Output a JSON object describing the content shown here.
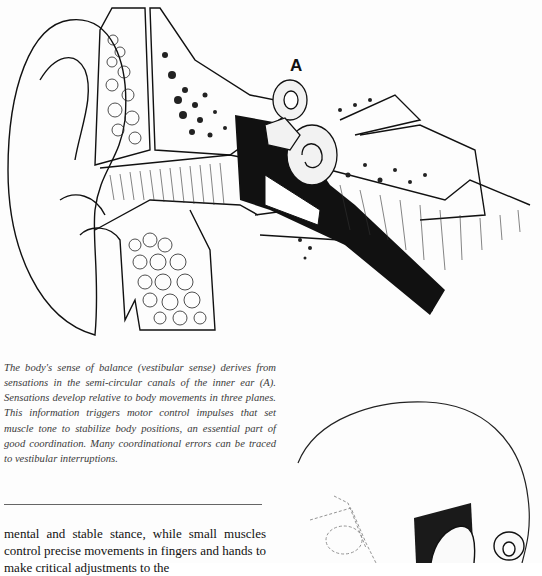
{
  "figure": {
    "label": "A"
  },
  "caption": {
    "text": "The body's sense of balance (vestibular sense) derives from sensations in the semi-circular canals of the inner ear (A). Sensations develop relative to body movements in three planes. This information triggers motor control impulses that set muscle tone to stabilize body positions, an essential part of good coordination. Many coordinational errors can be traced to vestibular interruptions."
  },
  "body": {
    "text": "mental and stable stance, while small muscles control precise movements in fingers and hands to make critical adjustments to the"
  },
  "second_figure": {
    "description": "Outline of a head in profile with inner ear structures drawn in, dashed outline of the vestibular organ"
  }
}
